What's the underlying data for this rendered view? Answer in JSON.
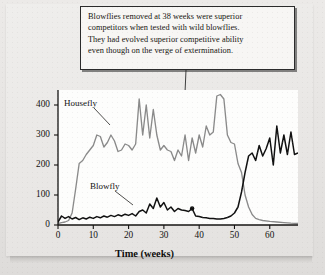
{
  "annotation": {
    "text": "Blowflies removed at 38 weeks were superior\ncompetitors when tested with wild blowflies.\nThey had evolved superior competitive ability\neven though on the verge of extermination."
  },
  "chart_data": {
    "type": "line",
    "title": "",
    "xlabel": "Time (weeks)",
    "ylabel": "Number of adults",
    "xlim": [
      0,
      68
    ],
    "ylim": [
      0,
      450
    ],
    "xticks": [
      0,
      10,
      20,
      30,
      40,
      50,
      60
    ],
    "yticks": [
      0,
      100,
      200,
      300,
      400
    ],
    "grid": false,
    "legend_position": "inline-labels",
    "annotation_marker": {
      "label": "removal point",
      "x": 38,
      "y": 55
    },
    "series": [
      {
        "name": "Housefly",
        "color": "#8a8a8a",
        "x": [
          0,
          1,
          2,
          3,
          4,
          5,
          6,
          7,
          8,
          9,
          10,
          11,
          12,
          13,
          14,
          15,
          16,
          17,
          18,
          19,
          20,
          21,
          22,
          23,
          24,
          25,
          26,
          27,
          28,
          29,
          30,
          31,
          32,
          33,
          34,
          35,
          36,
          37,
          38,
          39,
          40,
          41,
          42,
          43,
          44,
          45,
          46,
          47,
          48,
          49,
          50,
          51,
          52,
          53,
          54,
          55,
          56,
          57,
          58,
          60,
          62,
          64,
          66,
          68
        ],
        "values": [
          5,
          8,
          10,
          15,
          40,
          120,
          205,
          215,
          235,
          250,
          265,
          300,
          295,
          260,
          275,
          300,
          280,
          245,
          250,
          270,
          265,
          250,
          270,
          420,
          300,
          400,
          290,
          385,
          300,
          250,
          265,
          250,
          245,
          215,
          250,
          230,
          300,
          215,
          290,
          240,
          300,
          260,
          330,
          300,
          310,
          430,
          435,
          420,
          300,
          275,
          270,
          205,
          175,
          100,
          60,
          35,
          22,
          18,
          15,
          12,
          10,
          8,
          6,
          5
        ]
      },
      {
        "name": "Blowfly",
        "color": "#111111",
        "x": [
          0,
          1,
          2,
          3,
          4,
          5,
          6,
          7,
          8,
          9,
          10,
          11,
          12,
          13,
          14,
          15,
          16,
          17,
          18,
          19,
          20,
          21,
          22,
          23,
          24,
          25,
          26,
          27,
          28,
          29,
          30,
          31,
          32,
          33,
          34,
          35,
          36,
          37,
          38,
          39,
          40,
          41,
          42,
          43,
          44,
          45,
          46,
          47,
          48,
          49,
          50,
          51,
          52,
          53,
          54,
          55,
          56,
          57,
          58,
          59,
          60,
          61,
          62,
          63,
          64,
          65,
          66,
          67,
          68
        ],
        "values": [
          10,
          30,
          22,
          28,
          20,
          25,
          18,
          24,
          20,
          26,
          22,
          28,
          24,
          30,
          26,
          32,
          28,
          34,
          30,
          36,
          32,
          38,
          30,
          45,
          50,
          40,
          70,
          55,
          90,
          60,
          75,
          50,
          60,
          45,
          55,
          50,
          48,
          45,
          55,
          30,
          28,
          25,
          24,
          22,
          22,
          20,
          20,
          22,
          25,
          30,
          40,
          60,
          110,
          175,
          230,
          240,
          215,
          265,
          230,
          255,
          290,
          200,
          330,
          240,
          300,
          235,
          310,
          235,
          240
        ]
      }
    ]
  },
  "labels": {
    "housefly": "Housefly",
    "blowfly": "Blowfly"
  }
}
